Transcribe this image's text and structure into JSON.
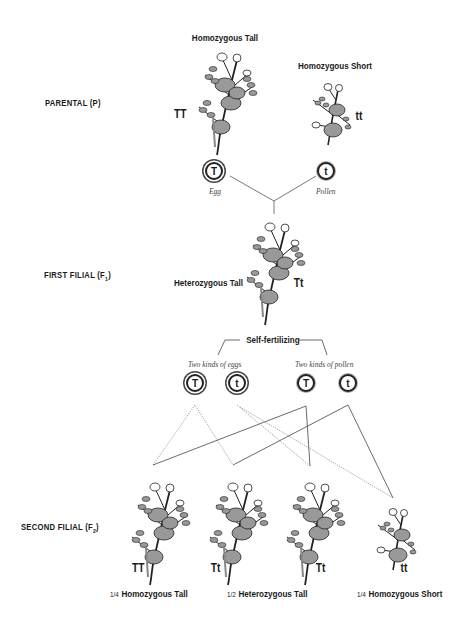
{
  "generations": {
    "parental": {
      "label": "PARENTAL (P)"
    },
    "first_filial": {
      "label": "FIRST FILIAL (F",
      "sub": "1",
      "close": ")"
    },
    "second_filial": {
      "label": "SECOND FILIAL (F",
      "sub": "2",
      "close": ")"
    }
  },
  "parental_plants": [
    {
      "title": "Homozygous Tall",
      "genotype": "TT"
    },
    {
      "title": "Homozygous Short",
      "genotype": "tt"
    }
  ],
  "parental_gametes": [
    {
      "allele": "T",
      "caption": "Egg",
      "type": "egg"
    },
    {
      "allele": "t",
      "caption": "Pollen",
      "type": "pollen"
    }
  ],
  "f1_plant": {
    "title": "Heterozygous Tall",
    "genotype": "Tt"
  },
  "self_fertilizing": {
    "label": "Self-fertilizing",
    "eggs_caption": "Two kinds of eggs",
    "pollen_caption": "Two kinds of pollen",
    "eggs": [
      "T",
      "t"
    ],
    "pollen": [
      "T",
      "t"
    ]
  },
  "f2_plants": [
    {
      "genotype": "TT"
    },
    {
      "genotype": "Tt"
    },
    {
      "genotype": "Tt"
    },
    {
      "genotype": "tt"
    }
  ],
  "f2_ratios": [
    {
      "fraction": "1/4",
      "label": "Homozygous Tall"
    },
    {
      "fraction": "1/2",
      "label": "Heterozygous Tall"
    },
    {
      "fraction": "1/4",
      "label": "Homozygous Short"
    }
  ]
}
